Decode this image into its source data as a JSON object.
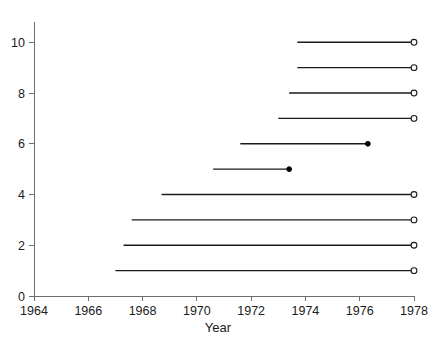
{
  "chart_data": {
    "type": "line",
    "title": "",
    "xlabel": "Year",
    "ylabel": "",
    "xlim": [
      1964,
      1978
    ],
    "ylim": [
      0,
      10.8
    ],
    "grid": false,
    "legend": null,
    "xticks": [
      1964,
      1966,
      1968,
      1970,
      1972,
      1974,
      1976,
      1978
    ],
    "xticklabels": [
      "1964",
      "1966",
      "1968",
      "1970",
      "1972",
      "1974",
      "1976",
      "1978"
    ],
    "yticks": [
      0,
      2,
      4,
      6,
      8,
      10
    ],
    "yticklabels": [
      "0",
      "2",
      "4",
      "6",
      "8",
      "10"
    ],
    "series": [
      {
        "name": "subject-1",
        "y": 1,
        "x_start": 1967.0,
        "x_end": 1978.0,
        "end_marker": "open"
      },
      {
        "name": "subject-2",
        "y": 2,
        "x_start": 1967.3,
        "x_end": 1978.0,
        "end_marker": "open"
      },
      {
        "name": "subject-3",
        "y": 3,
        "x_start": 1967.6,
        "x_end": 1978.0,
        "end_marker": "open"
      },
      {
        "name": "subject-4",
        "y": 4,
        "x_start": 1968.7,
        "x_end": 1978.0,
        "end_marker": "open"
      },
      {
        "name": "subject-5",
        "y": 5,
        "x_start": 1970.6,
        "x_end": 1973.4,
        "end_marker": "closed"
      },
      {
        "name": "subject-6",
        "y": 6,
        "x_start": 1971.6,
        "x_end": 1976.3,
        "end_marker": "closed"
      },
      {
        "name": "subject-7",
        "y": 7,
        "x_start": 1973.0,
        "x_end": 1978.0,
        "end_marker": "open"
      },
      {
        "name": "subject-8",
        "y": 8,
        "x_start": 1973.4,
        "x_end": 1978.0,
        "end_marker": "open"
      },
      {
        "name": "subject-9",
        "y": 9,
        "x_start": 1973.7,
        "x_end": 1978.0,
        "end_marker": "open"
      },
      {
        "name": "subject-10",
        "y": 10,
        "x_start": 1973.7,
        "x_end": 1978.0,
        "end_marker": "open"
      }
    ]
  },
  "colors": {
    "axis": "#6e6e6e",
    "line": "#1a1a1a",
    "marker_fill_open": "#ffffff",
    "marker_fill_closed": "#000000",
    "background": "#ffffff"
  }
}
